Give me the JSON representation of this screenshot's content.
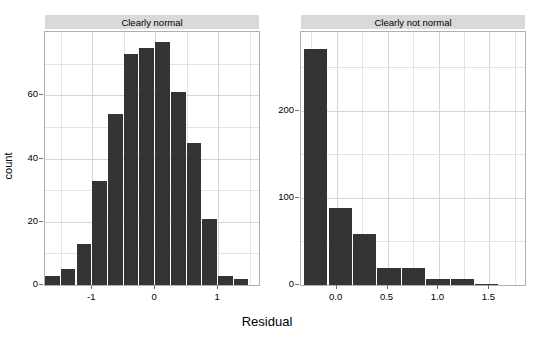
{
  "figure": {
    "xlabel": "Residual",
    "ylabel": "count"
  },
  "chart_data": {
    "type": "bar",
    "title": "",
    "xlabel": "Residual",
    "ylabel": "count",
    "grid": true,
    "legend": "none",
    "facets": [
      {
        "label": "Clearly normal",
        "xlim": [
          -1.75,
          1.65
        ],
        "ylim": [
          0,
          80
        ],
        "xticks": [
          -1,
          0,
          1
        ],
        "xticklabels": [
          "-1",
          "0",
          "1"
        ],
        "yticks": [
          0,
          20,
          40,
          60
        ],
        "yticklabels": [
          "0",
          "20",
          "40",
          "60"
        ],
        "bin_width": 0.25,
        "bin_starts": [
          -1.75,
          -1.5,
          -1.25,
          -1.0,
          -0.75,
          -0.5,
          -0.25,
          0.0,
          0.25,
          0.5,
          0.75,
          1.0,
          1.25
        ],
        "values": [
          3,
          5,
          13,
          33,
          54,
          73,
          75,
          77,
          61,
          45,
          21,
          3,
          2
        ]
      },
      {
        "label": "Clearly not normal",
        "xlim": [
          -0.35,
          1.85
        ],
        "ylim": [
          0,
          290
        ],
        "xticks": [
          0.0,
          0.5,
          1.0,
          1.5
        ],
        "xticklabels": [
          "0.0",
          "0.5",
          "1.0",
          "1.5"
        ],
        "yticks": [
          0,
          100,
          200
        ],
        "yticklabels": [
          "0",
          "100",
          "200"
        ],
        "bin_width": 0.24,
        "bin_starts": [
          -0.32,
          -0.08,
          0.16,
          0.4,
          0.64,
          0.88,
          1.12,
          1.36
        ],
        "values": [
          270,
          88,
          58,
          19,
          19,
          7,
          7,
          1
        ]
      }
    ]
  }
}
